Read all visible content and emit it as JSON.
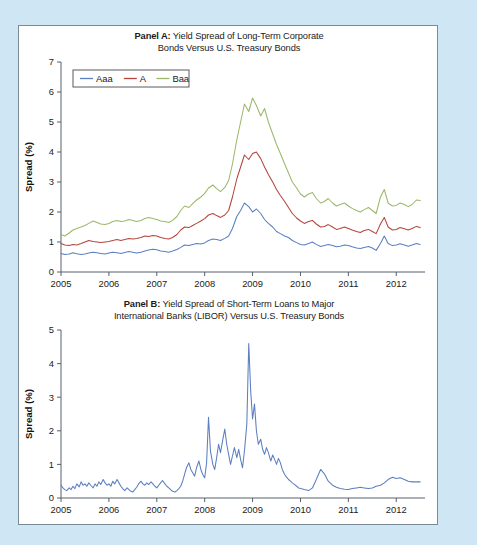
{
  "figure": {
    "background_color": "#cfe7f5",
    "panel_background": "#ffffff",
    "border_color": "#7a8a96"
  },
  "panel_a": {
    "title_bold": "Panel A:",
    "title_rest": " Yield Spread of Long-Term Corporate",
    "title_line2": "Bonds Versus U.S. Treasury Bonds",
    "legend": [
      {
        "label": "Aaa",
        "color": "#5b7fc0"
      },
      {
        "label": "A",
        "color": "#b3453c"
      },
      {
        "label": "Baa",
        "color": "#9cb86a"
      }
    ]
  },
  "panel_b": {
    "title_bold": "Panel B:",
    "title_rest": " Yield Spread of Short-Term Loans to Major",
    "title_line2": "International Banks (LIBOR) Versus U.S. Treasury Bonds",
    "series_color": "#5b7fc0"
  },
  "chart_data": [
    {
      "type": "line",
      "id": "panel-a",
      "title": "Panel A: Yield Spread of Long-Term Corporate Bonds Versus U.S. Treasury Bonds",
      "xlabel": "",
      "ylabel": "Spread (%)",
      "xlim": [
        2005.0,
        2012.6
      ],
      "ylim": [
        0,
        7
      ],
      "xticks": [
        2005,
        2006,
        2007,
        2008,
        2009,
        2010,
        2011,
        2012
      ],
      "xtick_labels": [
        "2005",
        "2006",
        "2007",
        "2008",
        "2009",
        "2010",
        "2011",
        "2012"
      ],
      "yticks": [
        0,
        1,
        2,
        3,
        4,
        5,
        6,
        7
      ],
      "ytick_labels": [
        "0",
        "1",
        "2",
        "3",
        "4",
        "5",
        "6",
        "7"
      ],
      "grid": false,
      "legend_position": "top-left",
      "x": [
        2005.0,
        2005.08,
        2005.17,
        2005.25,
        2005.33,
        2005.42,
        2005.5,
        2005.58,
        2005.67,
        2005.75,
        2005.83,
        2005.92,
        2006.0,
        2006.08,
        2006.17,
        2006.25,
        2006.33,
        2006.42,
        2006.5,
        2006.58,
        2006.67,
        2006.75,
        2006.83,
        2006.92,
        2007.0,
        2007.08,
        2007.17,
        2007.25,
        2007.33,
        2007.42,
        2007.5,
        2007.58,
        2007.67,
        2007.75,
        2007.83,
        2007.92,
        2008.0,
        2008.08,
        2008.17,
        2008.25,
        2008.33,
        2008.42,
        2008.5,
        2008.58,
        2008.67,
        2008.75,
        2008.83,
        2008.92,
        2009.0,
        2009.08,
        2009.17,
        2009.25,
        2009.33,
        2009.42,
        2009.5,
        2009.58,
        2009.67,
        2009.75,
        2009.83,
        2009.92,
        2010.0,
        2010.08,
        2010.17,
        2010.25,
        2010.33,
        2010.42,
        2010.5,
        2010.58,
        2010.67,
        2010.75,
        2010.83,
        2010.92,
        2011.0,
        2011.08,
        2011.17,
        2011.25,
        2011.33,
        2011.42,
        2011.5,
        2011.58,
        2011.67,
        2011.75,
        2011.83,
        2011.92,
        2012.0,
        2012.08,
        2012.17,
        2012.25,
        2012.33,
        2012.42,
        2012.5
      ],
      "series": [
        {
          "name": "Aaa",
          "color": "#5b7fc0",
          "values": [
            0.62,
            0.58,
            0.6,
            0.64,
            0.61,
            0.58,
            0.6,
            0.63,
            0.66,
            0.64,
            0.62,
            0.6,
            0.63,
            0.66,
            0.64,
            0.62,
            0.65,
            0.68,
            0.66,
            0.63,
            0.66,
            0.7,
            0.73,
            0.76,
            0.74,
            0.7,
            0.68,
            0.66,
            0.7,
            0.75,
            0.82,
            0.9,
            0.88,
            0.92,
            0.95,
            0.93,
            0.97,
            1.05,
            1.1,
            1.08,
            1.05,
            1.12,
            1.2,
            1.45,
            1.85,
            2.05,
            2.3,
            2.18,
            2.0,
            2.1,
            1.95,
            1.75,
            1.62,
            1.5,
            1.35,
            1.28,
            1.2,
            1.15,
            1.05,
            0.98,
            0.92,
            0.9,
            0.95,
            1.0,
            0.92,
            0.85,
            0.88,
            0.92,
            0.88,
            0.84,
            0.86,
            0.9,
            0.88,
            0.84,
            0.8,
            0.78,
            0.82,
            0.85,
            0.8,
            0.72,
            0.95,
            1.2,
            0.95,
            0.88,
            0.9,
            0.94,
            0.9,
            0.86,
            0.9,
            0.95,
            0.92
          ]
        },
        {
          "name": "A",
          "color": "#b3453c",
          "values": [
            0.95,
            0.9,
            0.88,
            0.92,
            0.9,
            0.95,
            1.0,
            1.05,
            1.02,
            1.0,
            0.98,
            1.0,
            1.02,
            1.05,
            1.08,
            1.05,
            1.08,
            1.12,
            1.1,
            1.12,
            1.15,
            1.2,
            1.18,
            1.22,
            1.2,
            1.15,
            1.12,
            1.1,
            1.15,
            1.25,
            1.4,
            1.5,
            1.48,
            1.55,
            1.62,
            1.7,
            1.78,
            1.9,
            1.95,
            1.88,
            1.82,
            1.9,
            2.05,
            2.5,
            3.1,
            3.5,
            3.9,
            3.75,
            3.95,
            4.0,
            3.78,
            3.5,
            3.25,
            3.0,
            2.75,
            2.55,
            2.35,
            2.15,
            1.95,
            1.8,
            1.7,
            1.62,
            1.68,
            1.72,
            1.6,
            1.5,
            1.52,
            1.58,
            1.5,
            1.42,
            1.45,
            1.5,
            1.45,
            1.4,
            1.35,
            1.32,
            1.38,
            1.42,
            1.35,
            1.28,
            1.6,
            1.82,
            1.5,
            1.4,
            1.42,
            1.48,
            1.44,
            1.4,
            1.45,
            1.52,
            1.48
          ]
        },
        {
          "name": "Baa",
          "color": "#9cb86a",
          "values": [
            1.25,
            1.2,
            1.3,
            1.4,
            1.45,
            1.5,
            1.55,
            1.62,
            1.7,
            1.65,
            1.6,
            1.58,
            1.62,
            1.68,
            1.72,
            1.68,
            1.7,
            1.75,
            1.72,
            1.68,
            1.72,
            1.78,
            1.82,
            1.78,
            1.75,
            1.7,
            1.68,
            1.65,
            1.72,
            1.85,
            2.05,
            2.2,
            2.15,
            2.28,
            2.4,
            2.5,
            2.62,
            2.8,
            2.9,
            2.78,
            2.68,
            2.82,
            3.05,
            3.6,
            4.4,
            5.0,
            5.6,
            5.35,
            5.8,
            5.55,
            5.2,
            5.45,
            5.0,
            4.6,
            4.25,
            3.95,
            3.6,
            3.3,
            3.0,
            2.8,
            2.6,
            2.5,
            2.6,
            2.65,
            2.45,
            2.3,
            2.35,
            2.45,
            2.3,
            2.2,
            2.25,
            2.3,
            2.2,
            2.12,
            2.05,
            2.0,
            2.08,
            2.15,
            2.05,
            1.95,
            2.5,
            2.75,
            2.3,
            2.2,
            2.22,
            2.3,
            2.25,
            2.18,
            2.25,
            2.4,
            2.38
          ]
        }
      ]
    },
    {
      "type": "line",
      "id": "panel-b",
      "title": "Panel B: Yield Spread of Short-Term Loans to Major International Banks (LIBOR) Versus U.S. Treasury Bonds",
      "xlabel": "",
      "ylabel": "Spread (%)",
      "xlim": [
        2005.0,
        2012.6
      ],
      "ylim": [
        0,
        5
      ],
      "xticks": [
        2005,
        2006,
        2007,
        2008,
        2009,
        2010,
        2011,
        2012
      ],
      "xtick_labels": [
        "2005",
        "2006",
        "2007",
        "2008",
        "2009",
        "2010",
        "2011",
        "2012"
      ],
      "yticks": [
        0,
        1,
        2,
        3,
        4,
        5
      ],
      "ytick_labels": [
        "0",
        "1",
        "2",
        "3",
        "4",
        "5"
      ],
      "grid": false,
      "legend_position": "none",
      "x": [
        2005.0,
        2005.04,
        2005.08,
        2005.12,
        2005.17,
        2005.21,
        2005.25,
        2005.29,
        2005.33,
        2005.38,
        2005.42,
        2005.46,
        2005.5,
        2005.54,
        2005.58,
        2005.62,
        2005.67,
        2005.71,
        2005.75,
        2005.79,
        2005.83,
        2005.88,
        2005.92,
        2005.96,
        2006.0,
        2006.04,
        2006.08,
        2006.12,
        2006.17,
        2006.21,
        2006.25,
        2006.29,
        2006.33,
        2006.38,
        2006.42,
        2006.46,
        2006.5,
        2006.54,
        2006.58,
        2006.62,
        2006.67,
        2006.71,
        2006.75,
        2006.79,
        2006.83,
        2006.88,
        2006.92,
        2006.96,
        2007.0,
        2007.04,
        2007.08,
        2007.12,
        2007.17,
        2007.21,
        2007.25,
        2007.29,
        2007.33,
        2007.38,
        2007.42,
        2007.46,
        2007.5,
        2007.54,
        2007.58,
        2007.62,
        2007.67,
        2007.71,
        2007.75,
        2007.79,
        2007.83,
        2007.88,
        2007.92,
        2007.96,
        2008.0,
        2008.04,
        2008.08,
        2008.12,
        2008.17,
        2008.21,
        2008.25,
        2008.29,
        2008.33,
        2008.38,
        2008.42,
        2008.46,
        2008.5,
        2008.54,
        2008.58,
        2008.62,
        2008.67,
        2008.71,
        2008.75,
        2008.79,
        2008.83,
        2008.88,
        2008.92,
        2008.96,
        2009.0,
        2009.04,
        2009.08,
        2009.12,
        2009.17,
        2009.21,
        2009.25,
        2009.29,
        2009.33,
        2009.38,
        2009.42,
        2009.46,
        2009.5,
        2009.54,
        2009.58,
        2009.62,
        2009.67,
        2009.71,
        2009.75,
        2009.79,
        2009.83,
        2009.88,
        2009.92,
        2009.96,
        2010.0,
        2010.08,
        2010.17,
        2010.25,
        2010.33,
        2010.42,
        2010.5,
        2010.58,
        2010.67,
        2010.75,
        2010.83,
        2010.92,
        2011.0,
        2011.08,
        2011.17,
        2011.25,
        2011.33,
        2011.42,
        2011.5,
        2011.58,
        2011.67,
        2011.75,
        2011.83,
        2011.92,
        2012.0,
        2012.08,
        2012.17,
        2012.25,
        2012.33,
        2012.42,
        2012.5
      ],
      "series": [
        {
          "name": "LIBOR spread",
          "color": "#5b7fc0",
          "values": [
            0.38,
            0.3,
            0.25,
            0.22,
            0.3,
            0.25,
            0.35,
            0.28,
            0.42,
            0.33,
            0.48,
            0.38,
            0.42,
            0.35,
            0.45,
            0.38,
            0.3,
            0.42,
            0.35,
            0.48,
            0.4,
            0.55,
            0.45,
            0.38,
            0.42,
            0.35,
            0.5,
            0.42,
            0.55,
            0.45,
            0.35,
            0.28,
            0.22,
            0.3,
            0.25,
            0.2,
            0.18,
            0.25,
            0.32,
            0.42,
            0.5,
            0.42,
            0.38,
            0.45,
            0.4,
            0.48,
            0.42,
            0.35,
            0.3,
            0.38,
            0.45,
            0.52,
            0.42,
            0.35,
            0.3,
            0.25,
            0.2,
            0.18,
            0.22,
            0.28,
            0.35,
            0.5,
            0.7,
            0.9,
            1.05,
            0.85,
            0.75,
            0.65,
            0.9,
            1.1,
            0.85,
            0.7,
            0.6,
            1.05,
            2.4,
            1.4,
            1.0,
            0.85,
            1.2,
            1.6,
            1.35,
            1.75,
            2.05,
            1.6,
            1.3,
            1.0,
            1.25,
            1.5,
            1.2,
            1.45,
            1.15,
            0.9,
            1.4,
            2.2,
            4.6,
            3.2,
            2.35,
            2.8,
            2.0,
            1.6,
            1.75,
            1.45,
            1.3,
            1.5,
            1.35,
            1.1,
            1.28,
            1.15,
            1.0,
            1.18,
            1.05,
            0.85,
            0.7,
            0.62,
            0.55,
            0.5,
            0.45,
            0.4,
            0.35,
            0.3,
            0.28,
            0.25,
            0.22,
            0.3,
            0.55,
            0.85,
            0.72,
            0.5,
            0.38,
            0.32,
            0.28,
            0.26,
            0.25,
            0.28,
            0.3,
            0.32,
            0.3,
            0.28,
            0.3,
            0.35,
            0.38,
            0.45,
            0.55,
            0.62,
            0.58,
            0.6,
            0.55,
            0.5,
            0.48,
            0.48,
            0.48
          ]
        }
      ]
    }
  ]
}
